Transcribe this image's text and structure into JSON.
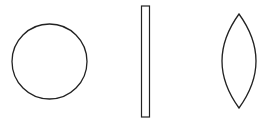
{
  "diagram": {
    "stroke_color": "#222222",
    "fill_color": "#ffffff",
    "shapes": [
      {
        "name": "circle",
        "type": "circle",
        "cx": 49.5,
        "cy": 61.5,
        "r": 37.5
      },
      {
        "name": "thin-rectangle",
        "type": "rect",
        "x": 141.5,
        "y": 6,
        "width": 8,
        "height": 111
      },
      {
        "name": "lens",
        "type": "lens",
        "top": [
          239,
          14
        ],
        "bottom": [
          239,
          108
        ],
        "left_x": 222,
        "right_x": 256
      }
    ]
  }
}
